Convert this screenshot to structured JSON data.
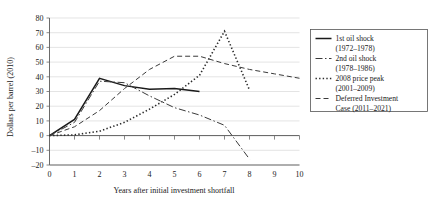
{
  "chart_data": {
    "type": "line",
    "title": "",
    "xlabel": "Years after initial investment shortfall",
    "ylabel": "Dollars per barrel (2010)",
    "xlim": [
      0,
      10
    ],
    "ylim": [
      -20,
      80
    ],
    "xticks": [
      0,
      1,
      2,
      3,
      4,
      5,
      6,
      7,
      8,
      9,
      10
    ],
    "yticks": [
      -20,
      -10,
      0,
      10,
      20,
      30,
      40,
      50,
      60,
      70,
      80
    ],
    "xticklabels": [
      "0",
      "1",
      "2",
      "3",
      "4",
      "5",
      "6",
      "7",
      "8",
      "9",
      "10"
    ],
    "yticklabels": [
      "-20",
      "-10",
      "0",
      "10",
      "20",
      "30",
      "40",
      "50",
      "60",
      "70",
      "80"
    ],
    "grid": true,
    "grid_axis": "y",
    "legend_position": "right",
    "series": [
      {
        "name": "1st oil shock (1972–1978)",
        "label_line1": "1st oil shock",
        "label_line2": "(1972–1978)",
        "style": "solid",
        "dash": "none",
        "color": "#1a1a1a",
        "width": 1.5,
        "x": [
          0,
          1,
          2,
          3,
          4,
          5,
          6
        ],
        "values": [
          0,
          11,
          39,
          34,
          31.5,
          32,
          30
        ]
      },
      {
        "name": "2nd oil shock (1978–1986)",
        "label_line1": "2nd oil shock",
        "label_line2": "(1978–1986)",
        "style": "dash-dot",
        "dash": "7,2.5,1.5,2.5",
        "color": "#3a3a3a",
        "width": 1.0,
        "x": [
          0,
          1,
          2,
          3,
          4,
          5,
          6,
          7,
          8
        ],
        "values": [
          0,
          9,
          37,
          36,
          27,
          19,
          14,
          7,
          -16
        ]
      },
      {
        "name": "2008 price peak (2001–2009)",
        "label_line1": "2008 price peak",
        "label_line2": "(2001–2009)",
        "style": "dotted",
        "dash": "1.4,2.2",
        "color": "#2b2b2b",
        "width": 1.6,
        "x": [
          0,
          1,
          2,
          3,
          4,
          5,
          6,
          7,
          8
        ],
        "values": [
          0,
          0.5,
          3,
          9,
          18,
          28,
          41,
          71,
          31
        ]
      },
      {
        "name": "Deferred Investment Case (2011–2021)",
        "label_line1": "Deferred Investment",
        "label_line2": "Case (2011–2021)",
        "style": "dashed",
        "dash": "5,3",
        "color": "#3a3a3a",
        "width": 1.0,
        "x": [
          0,
          1,
          2,
          3,
          4,
          5,
          6,
          7,
          8,
          9,
          10
        ],
        "values": [
          0,
          6,
          17,
          32,
          45,
          54,
          54,
          49,
          45,
          42,
          39
        ]
      }
    ]
  },
  "legend": {
    "entries": [
      {
        "line1": "1st oil shock",
        "line2": "(1972–1978)"
      },
      {
        "line1": "2nd oil shock",
        "line2": "(1978–1986)"
      },
      {
        "line1": "2008 price peak",
        "line2": "(2001–2009)"
      },
      {
        "line1": "Deferred Investment",
        "line2": "Case (2011–2021)"
      }
    ]
  }
}
